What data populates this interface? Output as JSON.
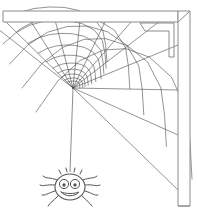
{
  "scene": {
    "title": "Spider web in corner with hanging spider",
    "description": "Black and white line drawing of a spider web spun across the corner of a wooden frame, with a cartoon smiling spider dangling from a thread below the web hub",
    "width": 197,
    "height": 218,
    "background_color": "#ffffff"
  },
  "colors": {
    "background": "#ffffff",
    "frame_stroke": "#8a8a8a",
    "web_stroke": "#4a4a4a",
    "dragline_stroke": "#5a5a5a",
    "spider_stroke": "#555555",
    "spider_fill": "#ffffff",
    "pupil_fill": "#555555"
  },
  "frame": {
    "label": "wooden corner frame",
    "top_beam": {
      "label": "horizontal beam",
      "x1": 3,
      "y1": 11,
      "x2": 178,
      "y2": 22
    },
    "right_beam": {
      "label": "vertical beam",
      "x1": 178,
      "y1": 11,
      "x2": 190,
      "y2": 206
    },
    "corner_bracket": {
      "label": "triangular corner gusset",
      "x": 140,
      "y": 22,
      "size": 34
    }
  },
  "web": {
    "label": "spider web",
    "hub_x": 73,
    "hub_y": 88,
    "radial_count": 11,
    "ring_count": 13,
    "start_angle_deg": 222,
    "end_angle_deg": 42,
    "outer_radius": 150
  },
  "dragline": {
    "label": "silk dragline thread",
    "x1": 73,
    "y1": 88,
    "x2": 70,
    "y2": 172
  },
  "spider": {
    "label": "cartoon spider",
    "center_x": 70,
    "center_y": 187,
    "body_rx": 15,
    "body_ry": 13,
    "leg_count": 8,
    "eye_count": 2,
    "expression": "smiling"
  }
}
